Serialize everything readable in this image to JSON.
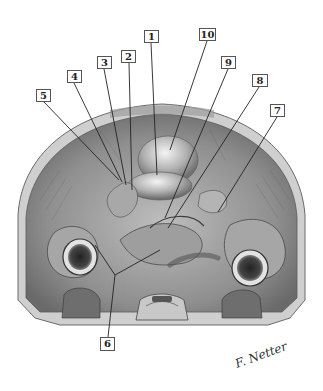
{
  "figure": {
    "type": "anatomical illustration",
    "view": "cross-section of upper abdomen / posterior wall (grayscale engraving style)",
    "signature": "F. Netter"
  },
  "labels": [
    {
      "id": "1",
      "text": "1",
      "box": [
        144,
        30,
        15,
        13
      ],
      "target": [
        157,
        175
      ]
    },
    {
      "id": "2",
      "text": "2",
      "box": [
        121,
        50,
        15,
        13
      ],
      "target": [
        132,
        190
      ]
    },
    {
      "id": "3",
      "text": "3",
      "box": [
        97,
        56,
        15,
        13
      ],
      "target": [
        126,
        185
      ]
    },
    {
      "id": "4",
      "text": "4",
      "box": [
        67,
        70,
        15,
        13
      ],
      "target": [
        122,
        182
      ]
    },
    {
      "id": "5",
      "text": "5",
      "box": [
        36,
        89,
        15,
        13
      ],
      "target": [
        119,
        180
      ]
    },
    {
      "id": "6",
      "text": "6",
      "box": [
        100,
        337,
        15,
        14
      ],
      "target": [
        115,
        275
      ]
    },
    {
      "id": "7",
      "text": "7",
      "box": [
        270,
        104,
        15,
        13
      ],
      "target": [
        218,
        212
      ]
    },
    {
      "id": "8",
      "text": "8",
      "box": [
        252,
        74,
        16,
        13
      ],
      "target": [
        168,
        228
      ]
    },
    {
      "id": "9",
      "text": "9",
      "box": [
        221,
        56,
        15,
        13
      ],
      "target": [
        165,
        218
      ]
    },
    {
      "id": "10",
      "text": "10",
      "box": [
        199,
        28,
        17,
        13
      ],
      "target": [
        170,
        150
      ]
    }
  ],
  "colors": {
    "background": "#ffffff",
    "illustration_dark": "#3a3a3a",
    "illustration_mid": "#8a8a8a",
    "illustration_light": "#d6d6d6",
    "leader_line": "#222222",
    "label_border": "#555555"
  }
}
